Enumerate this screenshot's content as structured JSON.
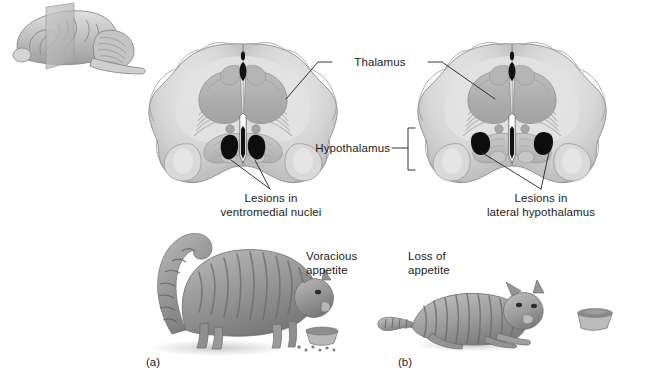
{
  "figure": {
    "background_color": "#ffffff",
    "width": 652,
    "height": 387
  },
  "inset": {
    "name": "Lateral view of brain with coronal section plane",
    "plane_label": ""
  },
  "labels": {
    "thalamus": "Thalamus",
    "hypothalamus": "Hypothalamus",
    "lesions_ventromedial": "Lesions in\nventromedial nuclei",
    "lesions_lateral": "Lesions in\nlateral hypothalamus",
    "voracious_appetite": "Voracious\nappetite",
    "loss_of_appetite": "Loss of\nappetite"
  },
  "panels": [
    {
      "letter": "(a)",
      "lesion_site": "ventromedial nuclei",
      "behavior": "Voracious appetite",
      "cat_state": "obese cat standing and eating from bowl"
    },
    {
      "letter": "(b)",
      "lesion_site": "lateral hypothalamus",
      "behavior": "Loss of appetite",
      "cat_state": "emaciated cat lying beside a full bowl"
    }
  ],
  "colors": {
    "line": "#2b2b2b",
    "text": "#1c1c1c",
    "lesion": "#0d0d0d",
    "brain_cortex": "#d2d2d2",
    "brain_white_matter": "#e4e4e4",
    "brain_gray_nuclei": "#adadad",
    "brain_outline": "#8d8d8d",
    "cat_body": "#9a9a9a",
    "cat_stripe": "#6f6f6f",
    "bowl": "#b4b4b4",
    "plane": "#b9b9b9"
  }
}
